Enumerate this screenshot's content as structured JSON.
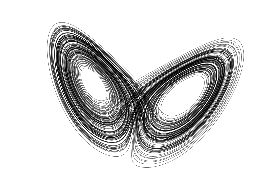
{
  "figure": {
    "title": "",
    "subtitle": "",
    "background_color": "#ffffff",
    "width": 264,
    "height": 189
  },
  "chart_data": {
    "type": "line",
    "title": "",
    "subtitle": "",
    "xlabel": "",
    "ylabel": "",
    "legend": [],
    "legend_position": "none",
    "grid": false,
    "axes_visible": false,
    "ticks_visible": false,
    "projection": "x-z",
    "system": "lorenz",
    "parameters": {
      "sigma": 10.0,
      "rho": 28.0,
      "beta": 2.6666666667
    },
    "initial_conditions": {
      "x": 0.9,
      "y": 1.6,
      "z": 22.0
    },
    "integration": {
      "method": "rk4",
      "dt": 0.0032,
      "steps": 62000,
      "skip_transient": 0
    },
    "xlim": [
      -22.5,
      22.5
    ],
    "zlim": [
      1.0,
      49.0
    ],
    "lobe_centers": [
      {
        "name": "left-lobe",
        "x": -8.485,
        "z": 27.0,
        "pixel_x": 88,
        "pixel_y": 85
      },
      {
        "name": "right-lobe",
        "x": 8.485,
        "z": 27.0,
        "pixel_x": 167,
        "pixel_y": 88
      }
    ],
    "pixel_extent": {
      "x_min": 18,
      "x_max": 240,
      "y_min": 13,
      "y_max": 175
    },
    "style": {
      "line_color": "#000000",
      "line_width": 0.34,
      "line_opacity": 0.62,
      "fill": "none"
    }
  },
  "transform": {
    "scale_x": 4.93,
    "scale_y": 3.34,
    "offset_x": 128.0,
    "offset_y": 176.0,
    "shear": 0.46,
    "rotate_deg": -7.0
  }
}
